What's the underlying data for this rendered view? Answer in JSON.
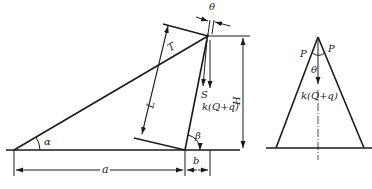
{
  "diagram": {
    "type": "mechanics-force-diagram",
    "left_figure": {
      "labels": {
        "theta": "θ",
        "T": "T",
        "S": "S",
        "load": "k(Q+q)",
        "L": "L",
        "H": "H",
        "alpha": "α",
        "beta": "β",
        "a": "a",
        "b": "b"
      }
    },
    "right_figure": {
      "labels": {
        "P_left": "P",
        "P_right": "P",
        "theta": "θ",
        "load": "k(Q+q)"
      }
    },
    "colors": {
      "line": "#1a1a1a",
      "text": "#222222",
      "background": "#ffffff"
    }
  }
}
